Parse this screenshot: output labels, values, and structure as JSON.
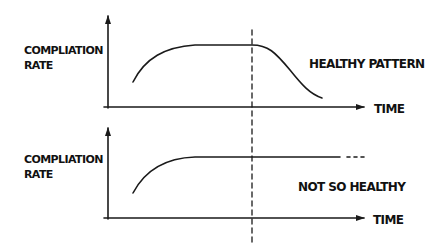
{
  "diagram": {
    "divider": {
      "style": "dashed",
      "x": 252
    },
    "panels": [
      {
        "id": "top",
        "y_axis_label_line1": "COMPLIATION",
        "y_axis_label_line2": "RATE",
        "x_axis_label": "TIME",
        "annotation": "HEALTHY PATTERN",
        "curve_description": "rises, plateaus, then declines after the divider"
      },
      {
        "id": "bottom",
        "y_axis_label_line1": "COMPLIATION",
        "y_axis_label_line2": "RATE",
        "x_axis_label": "TIME",
        "annotation": "NOT SO HEALTHY",
        "curve_description": "rises, plateaus and continues flat (dotted continuation)"
      }
    ],
    "colors": {
      "ink": "#1a1a1a",
      "background": "#ffffff"
    }
  }
}
